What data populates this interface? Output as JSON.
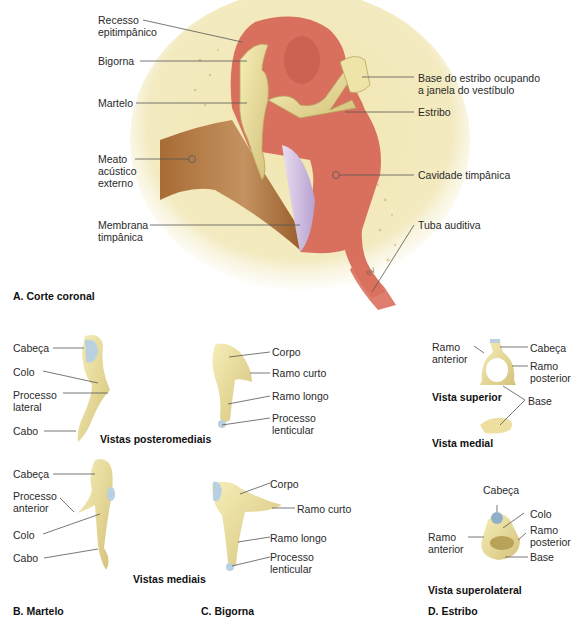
{
  "panels": {
    "A": {
      "title": "A. Corte coronal",
      "labels": {
        "recesso": "Recesso\nepitimpânico",
        "bigorna": "Bigorna",
        "martelo": "Martelo",
        "meato": "Meato\nacústico\nexterno",
        "membrana": "Membrana\ntimpânica",
        "base_estribo": "Base do estribo ocupando\na janela do vestíbulo",
        "estribo": "Estribo",
        "cavidade": "Cavidade timpânica",
        "tuba": "Tuba auditiva",
        "signature": "BV"
      }
    },
    "B": {
      "title": "B. Martelo",
      "view_posteromedial": "Vistas posteromediais",
      "view_medial": "Vistas mediais",
      "top_labels": {
        "cabeca": "Cabeça",
        "colo": "Colo",
        "processo_lateral": "Processo\nlateral",
        "cabo": "Cabo"
      },
      "bottom_labels": {
        "cabeca": "Cabeça",
        "processo_anterior": "Processo\nanterior",
        "colo": "Colo",
        "cabo": "Cabo"
      }
    },
    "C": {
      "title": "C. Bigorna",
      "top_labels": {
        "corpo": "Corpo",
        "ramo_curto": "Ramo curto",
        "ramo_longo": "Ramo longo",
        "processo_lenticular": "Processo\nlenticular"
      },
      "bottom_labels": {
        "corpo": "Corpo",
        "ramo_curto": "Ramo curto",
        "ramo_longo": "Ramo longo",
        "processo_lenticular": "Processo\nlenticular"
      }
    },
    "D": {
      "title": "D. Estribo",
      "view_superior": "Vista superior",
      "view_medial": "Vista medial",
      "view_superolateral": "Vista superolateral",
      "top_labels": {
        "ramo_anterior": "Ramo\nanterior",
        "cabeca": "Cabeça",
        "ramo_posterior": "Ramo\nposterior",
        "base": "Base"
      },
      "bottom_labels": {
        "cabeca": "Cabeça",
        "colo": "Colo",
        "ramo_anterior": "Ramo\nanterior",
        "ramo_posterior": "Ramo\nposterior",
        "base": "Base"
      }
    }
  },
  "colors": {
    "bone": "#efe5b2",
    "ossicle": "#e9dc9a",
    "cavity": "#d9705e",
    "cavity_light": "#e8998a",
    "canal": "#b07a45",
    "membrane": "#d8c8e8",
    "cartilage": "#b8d0e0",
    "leader": "#555555"
  }
}
